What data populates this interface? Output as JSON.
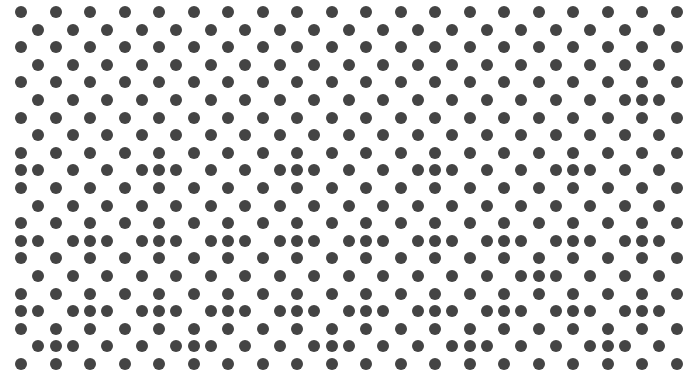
{
  "pattern": {
    "description": "Hexagonal dot lattice with clustered extra dots",
    "background_color": "#ffffff",
    "dot_color": "#444444",
    "dot_diameter": 12,
    "origin_x": 21,
    "origin_y": 12,
    "half_column_pitch": 17.25,
    "row_pitch": 17.6,
    "rows": 21,
    "half_columns": 38,
    "extra_dots_by_row": {
      "5": [
        36
      ],
      "9": [
        0,
        8,
        16,
        24,
        32
      ],
      "13": [
        0,
        4,
        8,
        12,
        16,
        20,
        24,
        28,
        32,
        36
      ],
      "15": [
        30
      ],
      "17": [
        0,
        4,
        8,
        12,
        16,
        20,
        24,
        28,
        32,
        36
      ],
      "19": [
        2,
        10,
        18,
        26,
        34
      ]
    }
  }
}
